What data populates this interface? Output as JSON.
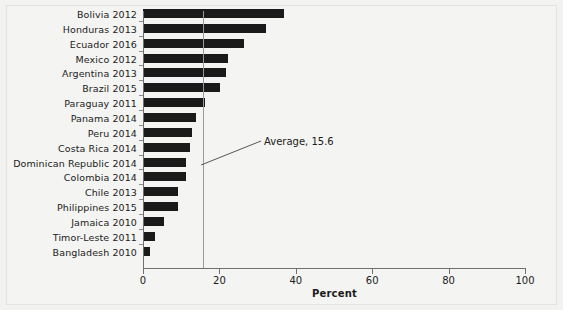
{
  "chart_data": {
    "type": "bar",
    "orientation": "horizontal",
    "title": "",
    "xlabel": "Percent",
    "ylabel": "",
    "xlim": [
      0,
      100
    ],
    "xticks": [
      0,
      20,
      40,
      60,
      80,
      100
    ],
    "grid": false,
    "legend": null,
    "categories": [
      "Bolivia 2012",
      "Honduras 2013",
      "Ecuador 2016",
      "Mexico 2012",
      "Argentina 2013",
      "Brazil 2015",
      "Paraguay 2011",
      "Panama 2014",
      "Peru 2014",
      "Costa Rica 2014",
      "Dominican Republic 2014",
      "Colombia 2014",
      "Chile 2013",
      "Philippines 2015",
      "Jamaica 2010",
      "Timor-Leste 2011",
      "Bangladesh 2010"
    ],
    "values": [
      36.8,
      32.2,
      26.4,
      22.3,
      21.7,
      20.1,
      16.2,
      13.9,
      12.8,
      12.3,
      11.3,
      11.2,
      9.2,
      9.1,
      5.5,
      3.2,
      1.8
    ],
    "annotations": [
      {
        "label": "Average, 15.6",
        "value": 15.6,
        "type": "reference-line"
      }
    ]
  },
  "colors": {
    "bar": "#1a1a1a",
    "average_line": "#9a9a9a",
    "axis": "#6f6f6f",
    "background": "#f4f4f2",
    "text": "#1b1b1b"
  }
}
